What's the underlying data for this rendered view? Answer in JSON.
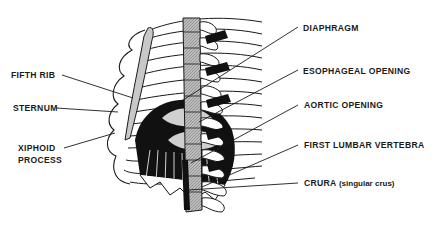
{
  "diagram": {
    "type": "anatomical-labeled-illustration",
    "colors": {
      "ink": "#1a1a1a",
      "shade": "#a0a0a0",
      "light": "#d8d8d8",
      "background": "#ffffff"
    },
    "labels_left": [
      {
        "id": "fifth-rib",
        "text": "FIFTH RIB"
      },
      {
        "id": "sternum",
        "text": "STERNUM"
      },
      {
        "id": "xiphoid-process",
        "line1": "XIPHOID",
        "line2": "PROCESS"
      }
    ],
    "labels_right": [
      {
        "id": "diaphragm",
        "text": "DIAPHRAGM"
      },
      {
        "id": "esophageal-opening",
        "text": "ESOPHAGEAL OPENING"
      },
      {
        "id": "aortic-opening",
        "text": "AORTIC OPENING"
      },
      {
        "id": "first-lumbar-vertebra",
        "text": "FIRST LUMBAR VERTEBRA"
      },
      {
        "id": "crura",
        "text": "CRURA",
        "note": "(singular crus)"
      }
    ]
  }
}
